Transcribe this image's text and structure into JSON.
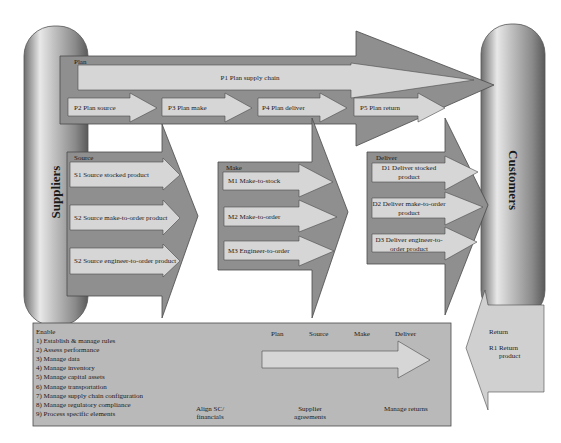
{
  "colors": {
    "panel_dark": "#8f8f8f",
    "panel_mid": "#a3a3a3",
    "arrow_light": "#d6d6d6",
    "enable_bg": "#b9b9b9",
    "return_bg": "#d0d0d0",
    "outline": "#4a4a4a"
  },
  "suppliers": {
    "label": "Suppliers"
  },
  "customers": {
    "label": "Customers"
  },
  "plan": {
    "label": "Plan",
    "p1": "P1 Plan supply chain",
    "p2": "P2 Plan source",
    "p3": "P3  Plan make",
    "p4": "P4 Plan deliver",
    "p5": "P5 Plan return"
  },
  "source": {
    "label": "Source",
    "items": [
      "S1 Source stocked product",
      "S2 Source make-to-order product",
      "S2 Source engineer-to-order product"
    ]
  },
  "make": {
    "label": "Make",
    "items": [
      "M1 Make-to-stock",
      "M2 Make-to-order",
      "M3 Engineer-to-order"
    ]
  },
  "deliver": {
    "label": "Deliver",
    "items": [
      [
        "D1 Deliver stocked",
        "product"
      ],
      [
        "D2 Deliver make-to-order",
        "product"
      ],
      [
        "D3 Deliver engineer-to-",
        "order product"
      ]
    ]
  },
  "enable": {
    "label": "Enable",
    "items": [
      "1) Establish & manage rules",
      "2) Assess performance",
      "3) Manage data",
      "4) Manage inventory",
      "5) Manage capital assets",
      "6) Manage transportation",
      "7) Manage supply chain configuration",
      "8) Manage regulatory compliance",
      "9) Process specific elements"
    ],
    "stages": [
      "Plan",
      "Source",
      "Make",
      "Deliver"
    ],
    "align": [
      "Align SC/",
      "financials"
    ],
    "supplier": [
      "Supplier",
      "agreements"
    ],
    "returns": "Manage returns"
  },
  "return": {
    "label": "Return",
    "r1": [
      "R1 Return",
      "product"
    ]
  }
}
